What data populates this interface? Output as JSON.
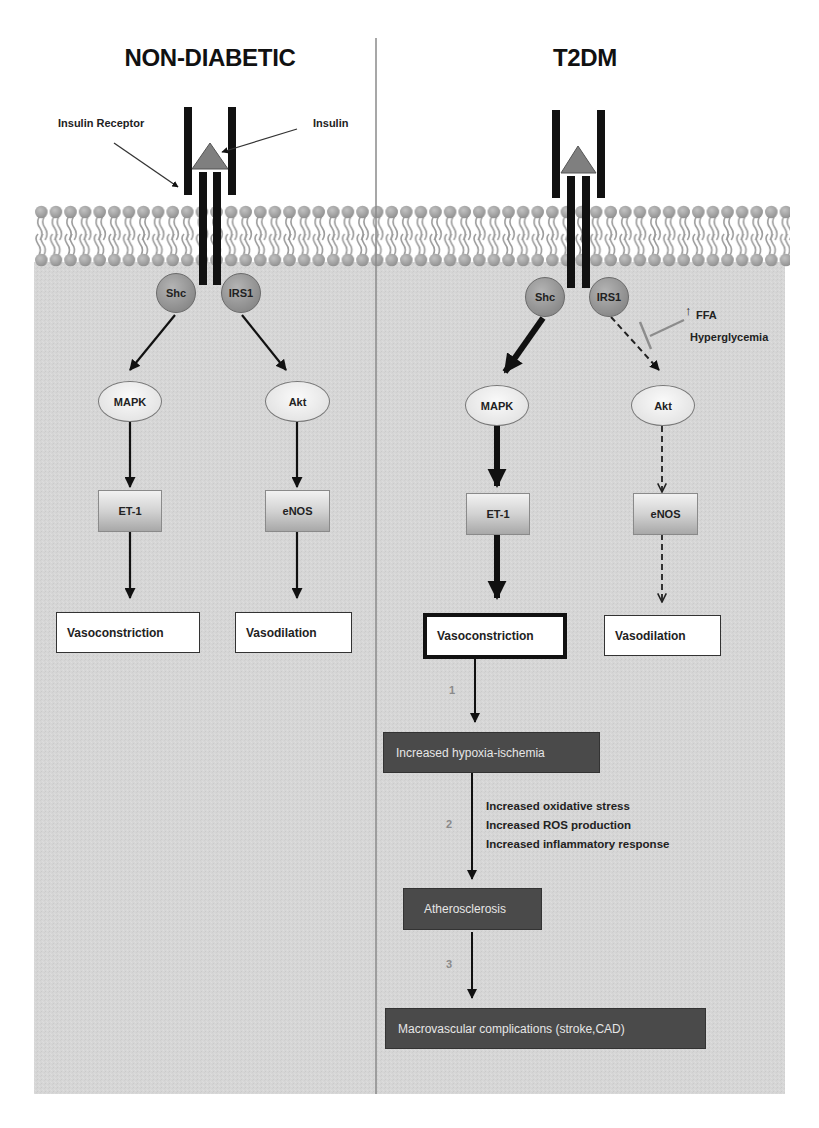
{
  "panels": {
    "left": {
      "title": "NON-DIABETIC",
      "annotations": {
        "receptor_label": "Insulin Receptor",
        "insulin_label": "Insulin"
      },
      "nodes": {
        "shc": "Shc",
        "irs1": "IRS1",
        "mapk": "MAPK",
        "akt": "Akt",
        "et1": "ET-1",
        "enos": "eNOS",
        "vasoconstriction": "Vasoconstriction",
        "vasodilation": "Vasodilation"
      }
    },
    "right": {
      "title": "T2DM",
      "nodes": {
        "shc": "Shc",
        "irs1": "IRS1",
        "mapk": "MAPK",
        "akt": "Akt",
        "et1": "ET-1",
        "enos": "eNOS",
        "vasoconstriction": "Vasoconstriction",
        "vasodilation": "Vasodilation"
      },
      "inhibitors": {
        "arrow_glyph": "↑",
        "line1": "FFA",
        "line2": "Hyperglycemia"
      },
      "cascade": {
        "steps": [
          {
            "number": "1",
            "label": "Increased hypoxia-ischemia"
          },
          {
            "number": "2",
            "label": "Atherosclerosis"
          },
          {
            "number": "3",
            "label": "Macrovascular complications (stroke,CAD)"
          }
        ],
        "effects": [
          "Increased oxidative stress",
          "Increased ROS production",
          "Increased inflammatory response"
        ]
      }
    }
  },
  "colors": {
    "cytoplasm": "#d6d6d6",
    "membrane_head": "#a6a6a6",
    "receptor": "#111111",
    "insulin": "#7f7f7f",
    "dark_box": "#4a4a4a",
    "inhibitor_line": "#8c8c8c",
    "divider": "#8a8a8a"
  }
}
